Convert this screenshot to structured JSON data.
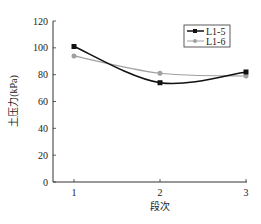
{
  "chart_data": {
    "type": "line",
    "title": "",
    "xlabel": "段次",
    "ylabel": "土压力(kPa)",
    "x": [
      1,
      2,
      3
    ],
    "xticks": [
      "1",
      "2",
      "3"
    ],
    "yticks": [
      "0",
      "20",
      "40",
      "60",
      "80",
      "100",
      "120"
    ],
    "ylim": [
      0,
      120
    ],
    "xlim": [
      0.75,
      3
    ],
    "grid": false,
    "legend_position": "upper right",
    "smooth": true,
    "series": [
      {
        "name": "L1-5",
        "values": [
          101,
          74,
          82
        ],
        "color": "#111111",
        "marker": "square"
      },
      {
        "name": "L1-6",
        "values": [
          94,
          81,
          79
        ],
        "color": "#a0a0a0",
        "marker": "circle"
      }
    ]
  }
}
